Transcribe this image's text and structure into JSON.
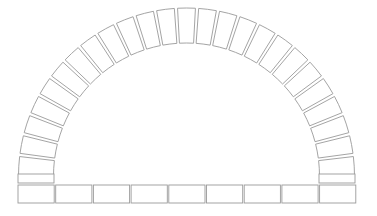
{
  "diagram": {
    "title": "Semicircular brick arch",
    "colors": {
      "background": "#ffffff",
      "stroke": "#9a9a9a",
      "fill": "#ffffff"
    },
    "arch": {
      "center": [
        186.5,
        176
      ],
      "outer_radius": 168,
      "inner_radius": 133,
      "voussoir_count": 25,
      "gap_degrees": 1.1
    },
    "spring_course": {
      "y_top": 174,
      "height": 9,
      "left": {
        "x": 18,
        "width": 36
      },
      "right": {
        "x": 319,
        "width": 36
      }
    },
    "base_row": {
      "x_start": 18,
      "y": 185,
      "height": 18,
      "count": 9,
      "brick_width": 36.2,
      "gap": 1.5
    }
  }
}
